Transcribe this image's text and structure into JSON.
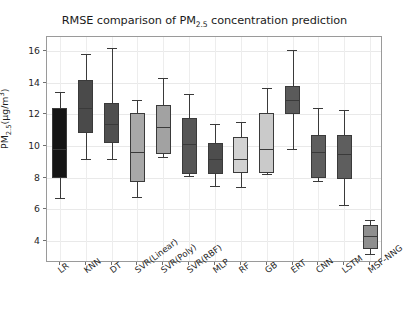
{
  "chart_data": {
    "type": "box",
    "title": "RMSE comparison of PM2.5 concentration prediction",
    "title_main_pre": "RMSE comparison of PM",
    "title_sub": "2.5",
    "title_main_post": " concentration prediction",
    "xlabel": "",
    "ylabel": "PM2.5(μg/m3)",
    "ylabel_pre": "PM",
    "ylabel_sub": "2.5",
    "ylabel_mid": "(μg/m",
    "ylabel_sup": "3",
    "ylabel_post": ")",
    "ylim": [
      2.6,
      16.9
    ],
    "ytick_labels": [
      "4",
      "6",
      "8",
      "10",
      "12",
      "14",
      "16"
    ],
    "ytick_values": [
      4,
      6,
      8,
      10,
      12,
      14,
      16
    ],
    "grid": true,
    "legend": "none",
    "categories": [
      "LR",
      "KNN",
      "DT",
      "SVR(Linear)",
      "SVR(Poly)",
      "SVR(RBF)",
      "MLP",
      "RF",
      "GB",
      "ERT",
      "CNN",
      "LSTM",
      "MSF-NNG"
    ],
    "boxes": [
      {
        "label": "LR",
        "whisker_low": 6.7,
        "q1": 8.0,
        "median": 9.8,
        "q3": 12.4,
        "whisker_high": 13.4,
        "color": "#151515"
      },
      {
        "label": "KNN",
        "whisker_low": 9.15,
        "q1": 10.8,
        "median": 12.4,
        "q3": 14.2,
        "whisker_high": 15.8,
        "color": "#4a4a4a"
      },
      {
        "label": "DT",
        "whisker_low": 9.2,
        "q1": 10.2,
        "median": 11.4,
        "q3": 12.7,
        "whisker_high": 16.2,
        "color": "#4f4f4f"
      },
      {
        "label": "SVR(Linear)",
        "whisker_low": 6.8,
        "q1": 7.7,
        "median": 9.6,
        "q3": 12.1,
        "whisker_high": 12.9,
        "color": "#a8a8a8"
      },
      {
        "label": "SVR(Poly)",
        "whisker_low": 9.3,
        "q1": 9.5,
        "median": 11.2,
        "q3": 12.6,
        "whisker_high": 14.3,
        "color": "#a2a2a2"
      },
      {
        "label": "SVR(RBF)",
        "whisker_low": 8.1,
        "q1": 8.2,
        "median": 10.1,
        "q3": 11.8,
        "whisker_high": 13.3,
        "color": "#565656"
      },
      {
        "label": "MLP",
        "whisker_low": 7.5,
        "q1": 8.2,
        "median": 9.2,
        "q3": 10.2,
        "whisker_high": 11.4,
        "color": "#4d4d4d"
      },
      {
        "label": "RF",
        "whisker_low": 7.4,
        "q1": 8.3,
        "median": 9.2,
        "q3": 10.6,
        "whisker_high": 11.5,
        "color": "#d2d2d2"
      },
      {
        "label": "GB",
        "whisker_low": 8.2,
        "q1": 8.3,
        "median": 9.8,
        "q3": 12.1,
        "whisker_high": 13.7,
        "color": "#cacaca"
      },
      {
        "label": "ERT",
        "whisker_low": 9.8,
        "q1": 12.0,
        "median": 12.9,
        "q3": 13.8,
        "whisker_high": 16.1,
        "color": "#5a5a5a"
      },
      {
        "label": "CNN",
        "whisker_low": 7.8,
        "q1": 8.0,
        "median": 9.6,
        "q3": 10.7,
        "whisker_high": 12.4,
        "color": "#5e5e5e"
      },
      {
        "label": "LSTM",
        "whisker_low": 6.3,
        "q1": 7.9,
        "median": 9.5,
        "q3": 10.7,
        "whisker_high": 12.3,
        "color": "#5e5e5e"
      },
      {
        "label": "MSF-NNG",
        "whisker_low": 3.2,
        "q1": 3.5,
        "median": 4.3,
        "q3": 5.0,
        "whisker_high": 5.3,
        "color": "#8f8f8f"
      }
    ]
  }
}
